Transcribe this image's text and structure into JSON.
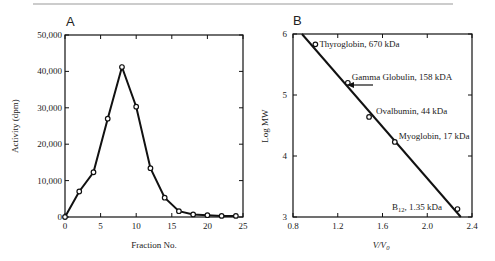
{
  "chart_data": [
    {
      "type": "line",
      "panel_label": "A",
      "title": "",
      "xlabel": "Fraction No.",
      "ylabel": "Activity (dpm)",
      "xlim": [
        0,
        25
      ],
      "ylim": [
        0,
        50000
      ],
      "x_ticks": [
        "0",
        "5",
        "10",
        "15",
        "20",
        "25"
      ],
      "y_ticks": [
        "0",
        "10,000",
        "20,000",
        "30,000",
        "40,000",
        "50,000"
      ],
      "grid": false,
      "x": [
        0,
        2,
        4,
        6,
        8,
        10,
        12,
        14,
        16,
        18,
        20,
        22,
        24
      ],
      "values": [
        0,
        7000,
        12300,
        27000,
        41200,
        30300,
        13400,
        5300,
        1600,
        700,
        500,
        300,
        300
      ]
    },
    {
      "type": "scatter",
      "panel_label": "B",
      "title": "",
      "xlabel": "V/V0",
      "ylabel": "Log MW",
      "xlim": [
        0.8,
        2.4
      ],
      "ylim": [
        3,
        6
      ],
      "x_ticks": [
        "0.8",
        "1.2",
        "1.6",
        "2.0",
        "2.4"
      ],
      "y_ticks": [
        "3",
        "4",
        "5",
        "6"
      ],
      "grid": false,
      "points": [
        {
          "label": "Thyroglobin, 670 kDa",
          "x": 1.0,
          "y": 5.83
        },
        {
          "label": "Gamma Globulin, 158 kDA",
          "x": 1.29,
          "y": 5.2
        },
        {
          "label": "Ovalbumin, 44 kDa",
          "x": 1.48,
          "y": 4.64
        },
        {
          "label": "Myoglobin, 17 kDa",
          "x": 1.71,
          "y": 4.23
        },
        {
          "label": "B12, 1.35 kDa",
          "x": 2.27,
          "y": 3.13
        }
      ],
      "fit_line": {
        "x": [
          0.88,
          2.3
        ],
        "y": [
          6.0,
          3.0
        ]
      },
      "annotation": "arrow pointing to Gamma Globulin"
    }
  ],
  "panelA": {
    "label": "A",
    "xlabel": "Fraction No.",
    "ylabel": "Activity (dpm)",
    "x_ticks": [
      "0",
      "5",
      "10",
      "15",
      "20",
      "25"
    ],
    "y_ticks": [
      "0",
      "10,000",
      "20,000",
      "30,000",
      "40,000",
      "50,000"
    ]
  },
  "panelB": {
    "label": "B",
    "xlabel": "V/V",
    "xlabel_sub": "0",
    "ylabel": "Log MW",
    "x_ticks": [
      "0.8",
      "1.2",
      "1.6",
      "2.0",
      "2.4"
    ],
    "y_ticks": [
      "3",
      "4",
      "5",
      "6"
    ],
    "labels": [
      "Thyroglobin, 670 kDa",
      "Gamma Globulin, 158 kDA",
      "Ovalbumin, 44 kDa",
      "Myoglobin, 17 kDa"
    ],
    "b12_main": "B",
    "b12_sub": "12",
    "b12_rest": ", 1.35 kDa"
  }
}
